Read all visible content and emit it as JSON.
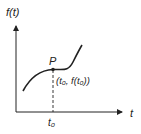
{
  "diagram": {
    "y_axis_label": "f(t)",
    "x_axis_label": "t",
    "point_label": "P",
    "point_coord_label": "(t₀, f(t₀))",
    "x_tick_label": "t₀",
    "colors": {
      "stroke": "#222222",
      "background": "#ffffff"
    }
  }
}
